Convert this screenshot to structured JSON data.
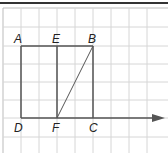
{
  "diagram": {
    "type": "geometry-grid",
    "grid": {
      "spacing_px": 18,
      "color": "#d6d6d6"
    },
    "points": {
      "A": {
        "label": "A"
      },
      "E": {
        "label": "E"
      },
      "B": {
        "label": "B"
      },
      "D": {
        "label": "D"
      },
      "F": {
        "label": "F"
      },
      "C": {
        "label": "C"
      }
    },
    "segments": [
      "AB",
      "BC",
      "CD",
      "DA",
      "EF",
      "FB"
    ],
    "ray": {
      "from": "D",
      "through": "C",
      "arrow": true
    },
    "colors": {
      "line": "#555555",
      "label": "#222222",
      "border": "#333333"
    }
  }
}
